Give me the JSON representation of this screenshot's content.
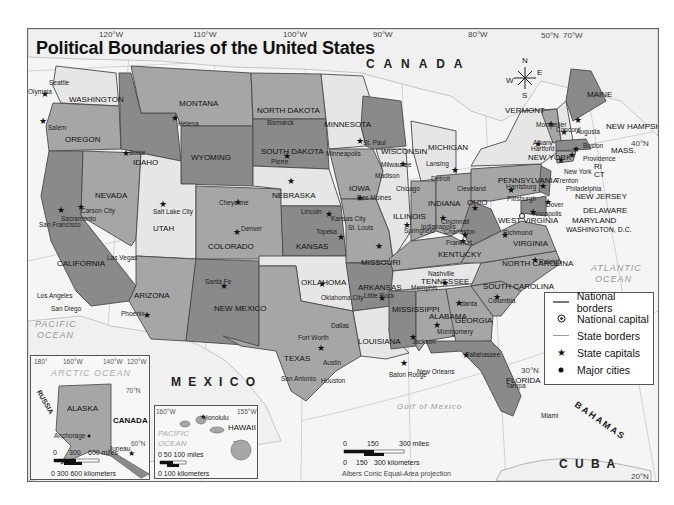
{
  "map": {
    "title": "Political Boundaries of the United States",
    "projection": "Albers Conic Equal-Area projection",
    "longitude_labels": [
      "120°W",
      "110°W",
      "100°W",
      "90°W",
      "80°W",
      "70°W"
    ],
    "latitude_labels": [
      "50°N",
      "40°N",
      "30°N",
      "20°N"
    ],
    "compass": {
      "n": "N",
      "s": "S",
      "e": "E",
      "w": "W"
    },
    "water_labels": {
      "pacific": "PACIFIC OCEAN",
      "pacific_line1": "PACIFIC",
      "pacific_line2": "OCEAN",
      "atlantic_line1": "ATLANTIC",
      "atlantic_line2": "OCEAN",
      "gulf": "Gulf of Mexico"
    },
    "country_labels": {
      "canada": "C A N A D A",
      "mexico": "M E X I C O",
      "cuba": "C U B A",
      "bahamas": "BAHAMAS"
    },
    "states": [
      {
        "name": "WASHINGTON",
        "capital": "Olympia"
      },
      {
        "name": "OREGON",
        "capital": "Salem"
      },
      {
        "name": "CALIFORNIA",
        "capital": "Sacramento"
      },
      {
        "name": "NEVADA",
        "capital": "Carson City"
      },
      {
        "name": "IDAHO",
        "capital": "Boise"
      },
      {
        "name": "MONTANA",
        "capital": "Helena"
      },
      {
        "name": "WYOMING",
        "capital": "Cheyenne"
      },
      {
        "name": "UTAH",
        "capital": "Salt Lake City"
      },
      {
        "name": "ARIZONA",
        "capital": "Phoenix"
      },
      {
        "name": "COLORADO",
        "capital": "Denver"
      },
      {
        "name": "NEW MEXICO",
        "capital": "Santa Fe"
      },
      {
        "name": "NORTH DAKOTA",
        "capital": "Bismarck"
      },
      {
        "name": "SOUTH DAKOTA",
        "capital": "Pierre"
      },
      {
        "name": "NEBRASKA",
        "capital": "Lincoln"
      },
      {
        "name": "KANSAS",
        "capital": "Topeka"
      },
      {
        "name": "OKLAHOMA",
        "capital": "Oklahoma City"
      },
      {
        "name": "TEXAS",
        "capital": "Austin"
      },
      {
        "name": "MINNESOTA",
        "capital": "St. Paul"
      },
      {
        "name": "IOWA",
        "capital": "Des Moines"
      },
      {
        "name": "MISSOURI",
        "capital": "Jefferson City"
      },
      {
        "name": "ARKANSAS",
        "capital": "Little Rock"
      },
      {
        "name": "LOUISIANA",
        "capital": "Baton Rouge"
      },
      {
        "name": "WISCONSIN",
        "capital": "Madison"
      },
      {
        "name": "ILLINOIS",
        "capital": "Springfield"
      },
      {
        "name": "MICHIGAN",
        "capital": "Lansing"
      },
      {
        "name": "INDIANA",
        "capital": "Indianapolis"
      },
      {
        "name": "OHIO",
        "capital": "Columbus"
      },
      {
        "name": "KENTUCKY",
        "capital": "Frankfort"
      },
      {
        "name": "TENNESSEE",
        "capital": "Nashville"
      },
      {
        "name": "MISSISSIPPI",
        "capital": "Jackson"
      },
      {
        "name": "ALABAMA",
        "capital": "Montgomery"
      },
      {
        "name": "GEORGIA",
        "capital": "Atlanta"
      },
      {
        "name": "FLORIDA",
        "capital": "Tallahassee"
      },
      {
        "name": "SOUTH CAROLINA",
        "capital": "Columbia"
      },
      {
        "name": "NORTH CAROLINA",
        "capital": "Raleigh"
      },
      {
        "name": "VIRGINIA",
        "capital": "Richmond"
      },
      {
        "name": "WEST VIRGINIA",
        "capital": "Charleston"
      },
      {
        "name": "PENNSYLVANIA",
        "capital": "Harrisburg"
      },
      {
        "name": "NEW YORK",
        "capital": "Albany"
      },
      {
        "name": "VERMONT",
        "capital": "Montpelier"
      },
      {
        "name": "NEW HAMPSHIRE",
        "capital": "Concord"
      },
      {
        "name": "MAINE",
        "capital": "Augusta"
      },
      {
        "name": "MASS.",
        "capital": "Boston"
      },
      {
        "name": "RI",
        "capital": "Providence"
      },
      {
        "name": "CT",
        "capital": "Hartford"
      },
      {
        "name": "NEW JERSEY",
        "capital": "Trenton"
      },
      {
        "name": "DELAWARE",
        "capital": "Dover"
      },
      {
        "name": "MARYLAND",
        "capital": "Annapolis"
      },
      {
        "name": "ALASKA",
        "capital": "Juneau"
      },
      {
        "name": "HAWAII",
        "capital": "Honolulu"
      }
    ],
    "national_capital": "WASHINGTON, D.C.",
    "major_cities": [
      "Seattle",
      "San Francisco",
      "Los Angeles",
      "San Diego",
      "Las Vegas",
      "Minneapolis",
      "Milwaukee",
      "Chicago",
      "Detroit",
      "Cleveland",
      "Pittsburgh",
      "Cincinnati",
      "St. Louis",
      "Kansas City",
      "Memphis",
      "New Orleans",
      "Dallas",
      "Fort Worth",
      "Houston",
      "San Antonio",
      "Tampa",
      "Miami",
      "New York",
      "Philadelphia",
      "Anchorage"
    ],
    "legend": [
      {
        "symbol": "national-border-line",
        "label": "National borders"
      },
      {
        "symbol": "national-capital-dot",
        "label": "National capital"
      },
      {
        "symbol": "state-border-line",
        "label": "State borders"
      },
      {
        "symbol": "star",
        "label": "State capitals"
      },
      {
        "symbol": "dot",
        "label": "Major cities"
      }
    ],
    "scale_main": {
      "miles": [
        "0",
        "150",
        "300 miles"
      ],
      "km": [
        "0",
        "150",
        "300 kilometers"
      ]
    },
    "inset_alaska": {
      "title": "ALASKA",
      "ocean": "ARCTIC OCEAN",
      "russia": "RUSSIA",
      "canada": "CANADA",
      "longitudes": [
        "180°",
        "160°W",
        "140°W",
        "120°W"
      ],
      "latitudes": [
        "70°N",
        "60°N"
      ],
      "scale_miles": [
        "0",
        "300",
        "600 miles"
      ],
      "scale_km": "0  300 600 kilometers"
    },
    "inset_hawaii": {
      "title": "HAWAII",
      "ocean_line1": "PACIFIC",
      "ocean_line2": "OCEAN",
      "longitudes": [
        "160°W",
        "155°W"
      ],
      "latitude": "20°N",
      "scale_miles": "0  50  100 miles",
      "scale_km": "0    100 kilometers"
    },
    "colors": {
      "dark": "#8a8a8a",
      "mid": "#a6a6a6",
      "light": "#c4c4c4",
      "pale": "#e6e6e6",
      "water": "#f6f6f6",
      "border": "#4a4a4a"
    }
  }
}
